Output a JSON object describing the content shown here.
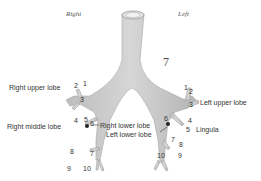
{
  "figure": {
    "side_labels": {
      "right": "Right",
      "left": "Left"
    },
    "center_number": "7",
    "lobe_labels": {
      "right_upper": "Right upper lobe",
      "right_middle": "Right middle lobe",
      "right_lower": "Right lower lobe",
      "left_lower": "Left lower lobe",
      "left_upper": "Left upper lobe",
      "lingula": "Lingula"
    },
    "segments_right": [
      "1",
      "2",
      "3",
      "4",
      "5",
      "6",
      "7",
      "8",
      "9",
      "10"
    ],
    "segments_left": [
      "1",
      "2",
      "3",
      "4",
      "5",
      "6",
      "7",
      "8",
      "9",
      "10"
    ],
    "colors": {
      "airway": "#c9c9c9",
      "airway_edge": "#9a9a9a",
      "text": "#333333"
    }
  }
}
